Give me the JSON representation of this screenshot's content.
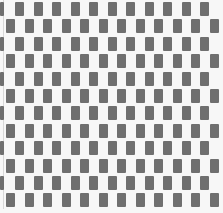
{
  "pattern": {
    "description": "Brick-offset grid of gray rectangles on white (optical illusion pattern)",
    "width": 223,
    "height": 213,
    "colors": {
      "background": "#f7f7f7",
      "block": "#6f6f6f"
    },
    "rows": 12,
    "row_pitch": 17.4,
    "row_start_y": 2,
    "block_height": 14,
    "block_width": 9,
    "col_pitch": 18.5,
    "odd_row_offset_x": 15,
    "even_row_offset_x": 6,
    "odd_row_has_left_partial": true
  }
}
